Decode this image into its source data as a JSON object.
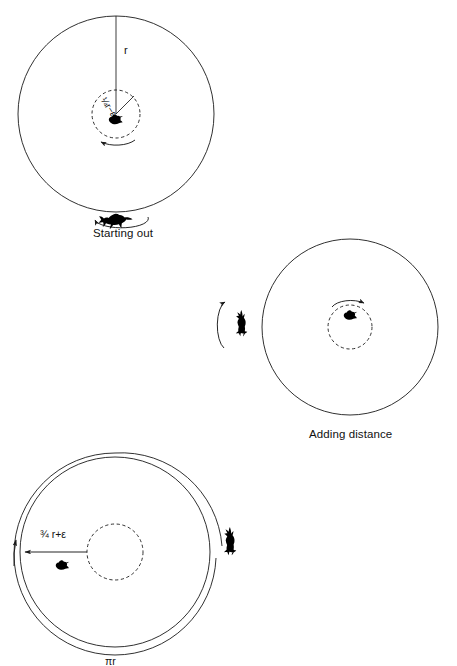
{
  "figure": {
    "type": "diagram",
    "background_color": "#ffffff",
    "stroke_color": "#1a1a1a",
    "panels": [
      {
        "id": "panel-1",
        "caption": "Starting out",
        "pond": {
          "cx": 116,
          "cy": 114,
          "r": 98,
          "style": "solid"
        },
        "inner_circle": {
          "cx": 116,
          "cy": 114,
          "r": 24,
          "style": "dashed"
        },
        "radius_line": {
          "label": "r",
          "from": "top",
          "to": "center"
        },
        "inner_radius_label": {
          "numerator": "1",
          "denominator": "4",
          "rest": "r−ε"
        },
        "duck": {
          "x": 116,
          "y": 120,
          "facing": "left"
        },
        "fox": {
          "x": 116,
          "y": 216,
          "facing": "left",
          "orientation": "horizontal"
        },
        "arrows": [
          {
            "name": "duck-rotation-arrow",
            "direction": "counterclockwise"
          },
          {
            "name": "fox-run-arrow",
            "direction": "left"
          }
        ]
      },
      {
        "id": "panel-2",
        "caption": "Adding distance",
        "pond": {
          "cx": 350,
          "cy": 327,
          "r": 88,
          "style": "solid"
        },
        "inner_circle": {
          "cx": 350,
          "cy": 327,
          "r": 22,
          "style": "dashed"
        },
        "duck": {
          "x": 350,
          "y": 316,
          "facing": "left"
        },
        "fox": {
          "x": 240,
          "y": 325,
          "facing": "up",
          "orientation": "vertical"
        },
        "arrows": [
          {
            "name": "duck-rotation-arrow",
            "direction": "clockwise"
          },
          {
            "name": "fox-run-arrow",
            "direction": "up"
          }
        ]
      },
      {
        "id": "panel-3",
        "caption": "",
        "pond": {
          "cx": 115,
          "cy": 552,
          "r": 95,
          "style": "solid"
        },
        "inner_circle": {
          "cx": 115,
          "cy": 552,
          "r": 28,
          "style": "dashed"
        },
        "distance_label": {
          "numerator": "3",
          "denominator": "4",
          "rest": "r+ε"
        },
        "arc_label": "πr",
        "duck": {
          "x": 62,
          "y": 565,
          "facing": "left"
        },
        "fox": {
          "x": 228,
          "y": 545,
          "facing": "up",
          "orientation": "vertical"
        },
        "arrows": [
          {
            "name": "distance-arrow",
            "direction": "left"
          },
          {
            "name": "fox-path-arc-arrow",
            "direction": "up"
          }
        ]
      }
    ]
  },
  "labels": {
    "radius_r": "r",
    "quarter_r_minus_eps": "¼r−ε",
    "three_quarter_r_plus_eps": "¾ r+ε",
    "pi_r": "πr",
    "caption_1": "Starting out",
    "caption_2": "Adding distance"
  }
}
